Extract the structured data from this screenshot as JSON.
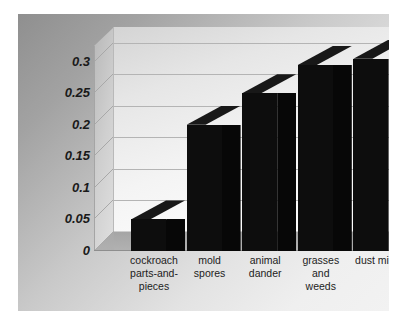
{
  "chart_data": {
    "type": "bar",
    "title": "",
    "subtitle": "",
    "xlabel": "",
    "ylabel": "",
    "categories": [
      "cockroach\nparts-and-\npieces",
      "mold\nspores",
      "animal\ndander",
      "grasses\nand\nweeds",
      "dust mite"
    ],
    "values": [
      0.05,
      0.2,
      0.25,
      0.295,
      0.305
    ],
    "ylim": [
      0,
      0.325
    ],
    "yticks": [
      0,
      0.05,
      0.1,
      0.15,
      0.2,
      0.25,
      0.3
    ],
    "ytick_labels": [
      "0",
      "0.05",
      "0.1",
      "0.15",
      "0.2",
      "0.25",
      "0.3"
    ],
    "grid": true,
    "legend": false,
    "legend_position": "none",
    "style": "3d-column",
    "bar_color": "#0d0d0d",
    "plot_background": "#f2f2f2",
    "panel_background": "#c9c9c9",
    "gridline_color": "#b4b4b4",
    "annotations": []
  },
  "axes": {
    "y": {
      "ticks": [
        {
          "label": "0.3",
          "value": 0.3
        },
        {
          "label": "0.25",
          "value": 0.25
        },
        {
          "label": "0.2",
          "value": 0.2
        },
        {
          "label": "0.15",
          "value": 0.15
        },
        {
          "label": "0.1",
          "value": 0.1
        },
        {
          "label": "0.05",
          "value": 0.05
        },
        {
          "label": "0",
          "value": 0.0
        }
      ]
    },
    "x": {
      "ticks": [
        {
          "label": "cockroach\nparts-and-\npieces"
        },
        {
          "label": "mold\nspores"
        },
        {
          "label": "animal\ndander"
        },
        {
          "label": "grasses\nand\nweeds"
        },
        {
          "label": "dust mite"
        }
      ]
    }
  }
}
